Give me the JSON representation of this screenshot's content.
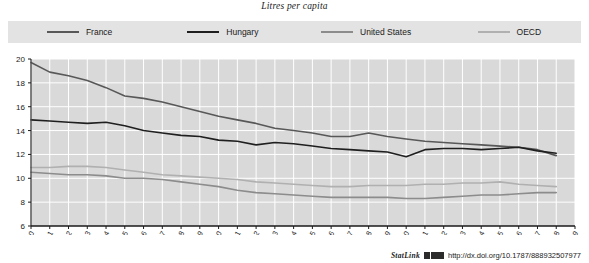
{
  "title": "Litres per capita",
  "legend": {
    "position": "top",
    "items": [
      {
        "label": "France",
        "color": "#585858"
      },
      {
        "label": "Hungary",
        "color": "#1f1f1f"
      },
      {
        "label": "United States",
        "color": "#8c8c8c"
      },
      {
        "label": "OECD",
        "color": "#b0b0b0"
      }
    ]
  },
  "footer": {
    "statlink_label": "StatLink",
    "glyph": "statlink-arrow-icon",
    "url": "http://dx.doi.org/10.1787/888932507977"
  },
  "axes": {
    "y_ticks": [
      "6",
      "8",
      "10",
      "12",
      "14",
      "16",
      "18",
      "20"
    ],
    "x_ticks": [
      "1980",
      "1981",
      "1982",
      "1983",
      "1984",
      "1985",
      "1986",
      "1987",
      "1988",
      "1989",
      "1990",
      "1991",
      "1992",
      "1993",
      "1994",
      "1995",
      "1996",
      "1997",
      "1998",
      "1999",
      "2000",
      "2001",
      "2002",
      "2003",
      "2004",
      "2005",
      "2006",
      "2007",
      "2008",
      "2009"
    ]
  },
  "colors": {
    "plot_background": "#d9d9d9",
    "gridline": "#ffffff",
    "axis": "#1a1a1a",
    "legend_background": "#e3e3e3"
  },
  "chart_data": {
    "type": "line",
    "title": "Litres per capita",
    "xlabel": "",
    "ylabel": "Litres per capita",
    "ylim": [
      6,
      20
    ],
    "xlim": [
      1980,
      2009
    ],
    "grid": true,
    "legend_position": "top",
    "x": [
      1980,
      1981,
      1982,
      1983,
      1984,
      1985,
      1986,
      1987,
      1988,
      1989,
      1990,
      1991,
      1992,
      1993,
      1994,
      1995,
      1996,
      1997,
      1998,
      1999,
      2000,
      2001,
      2002,
      2003,
      2004,
      2005,
      2006,
      2007,
      2008,
      2009
    ],
    "series": [
      {
        "name": "France",
        "color": "#585858",
        "values": [
          19.7,
          18.9,
          18.6,
          18.2,
          17.6,
          16.9,
          16.7,
          16.4,
          16.0,
          15.6,
          15.2,
          14.9,
          14.6,
          14.2,
          14.0,
          13.8,
          13.5,
          13.5,
          13.8,
          13.5,
          13.3,
          13.1,
          13.0,
          12.9,
          12.8,
          12.7,
          12.6,
          12.4,
          11.9,
          null
        ]
      },
      {
        "name": "Hungary",
        "color": "#1f1f1f",
        "values": [
          14.9,
          14.8,
          14.7,
          14.6,
          14.7,
          14.4,
          14.0,
          13.8,
          13.6,
          13.5,
          13.2,
          13.1,
          12.8,
          13.0,
          12.9,
          12.7,
          12.5,
          12.4,
          12.3,
          12.2,
          11.8,
          12.4,
          12.5,
          12.5,
          12.4,
          12.5,
          12.6,
          12.3,
          12.1,
          null
        ]
      },
      {
        "name": "United States",
        "color": "#8c8c8c",
        "values": [
          10.5,
          10.4,
          10.3,
          10.3,
          10.2,
          10.0,
          10.0,
          9.9,
          9.7,
          9.5,
          9.3,
          9.0,
          8.8,
          8.7,
          8.6,
          8.5,
          8.4,
          8.4,
          8.4,
          8.4,
          8.3,
          8.3,
          8.4,
          8.5,
          8.6,
          8.6,
          8.7,
          8.8,
          8.8,
          null
        ]
      },
      {
        "name": "OECD",
        "color": "#b0b0b0",
        "values": [
          10.9,
          10.9,
          11.0,
          11.0,
          10.9,
          10.7,
          10.5,
          10.3,
          10.2,
          10.1,
          10.0,
          9.9,
          9.7,
          9.6,
          9.5,
          9.4,
          9.3,
          9.3,
          9.4,
          9.4,
          9.4,
          9.5,
          9.5,
          9.6,
          9.6,
          9.7,
          9.5,
          9.4,
          9.3,
          null
        ]
      }
    ]
  }
}
